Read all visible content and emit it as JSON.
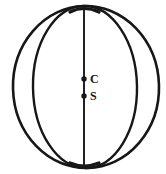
{
  "figure": {
    "kind": "line-drawing",
    "background_color": "#ffffff",
    "ink_color": "#171717"
  },
  "diagram": {
    "outer_circle": {
      "name": "sphere-outline",
      "center_x": 86,
      "center_y": 87,
      "radius_x": 73,
      "radius_y": 81,
      "stroke_width": 2.6
    },
    "inner_ellipse": {
      "name": "meridian-ellipse",
      "center_x": 85,
      "center_y": 87,
      "radius_x": 52,
      "radius_y": 81,
      "stroke_width": 2.4
    },
    "polar_axis": {
      "name": "polar-axis-line",
      "x": 84,
      "y_top": 8,
      "y_bottom": 167,
      "stroke_width": 1.8
    },
    "points": [
      {
        "id": "C",
        "label": "C",
        "x": 84,
        "y": 79,
        "radius": 2.6
      },
      {
        "id": "S",
        "label": "S",
        "x": 84,
        "y": 96,
        "radius": 2.6
      }
    ]
  },
  "labels": {
    "point_c": "C",
    "point_s": "S"
  }
}
